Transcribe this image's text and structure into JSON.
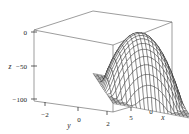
{
  "figure": {
    "kind": "3d-surface-plot",
    "background_color": "#ffffff",
    "line_color": "#1c1c1c",
    "surface_fill_color": "#ffffff",
    "box_outline_color": "#4a4a4a"
  },
  "chart_data": {
    "type": "line",
    "render": "3d-wireframe-surface",
    "title": "",
    "subtitle": "",
    "xlabel": "x",
    "ylabel": "y",
    "zlabel": "z",
    "xticklabels": [
      "5",
      "0",
      "−5"
    ],
    "xtickvalues": [
      5,
      0,
      -5
    ],
    "yticklabels": [
      "−2",
      "0",
      "2"
    ],
    "ytickvalues": [
      -2,
      0,
      2
    ],
    "zticklabels": [
      "0",
      "−50",
      "−100"
    ],
    "ztickvalues": [
      0,
      -50,
      -100
    ],
    "xlim": [
      -5,
      5
    ],
    "ylim": [
      -3,
      3
    ],
    "zlim": [
      -120,
      5
    ],
    "grid": false,
    "legend": false,
    "legend_position": "none",
    "mesh_nx": 21,
    "mesh_ny": 21,
    "surface_shape": "downward-opening dome (concave paraboloid)",
    "peak_value": 0,
    "min_corner_value": -110,
    "annotations": []
  },
  "axes": {
    "z": {
      "name": "z",
      "ticks": [
        {
          "label": "0"
        },
        {
          "label": "−50"
        },
        {
          "label": "−100"
        }
      ]
    },
    "y": {
      "name": "y",
      "ticks": [
        {
          "label": "−2"
        },
        {
          "label": "0"
        },
        {
          "label": "2"
        }
      ]
    },
    "x": {
      "name": "x",
      "ticks": [
        {
          "label": "5"
        },
        {
          "label": "0"
        },
        {
          "label": "−5"
        }
      ]
    }
  }
}
